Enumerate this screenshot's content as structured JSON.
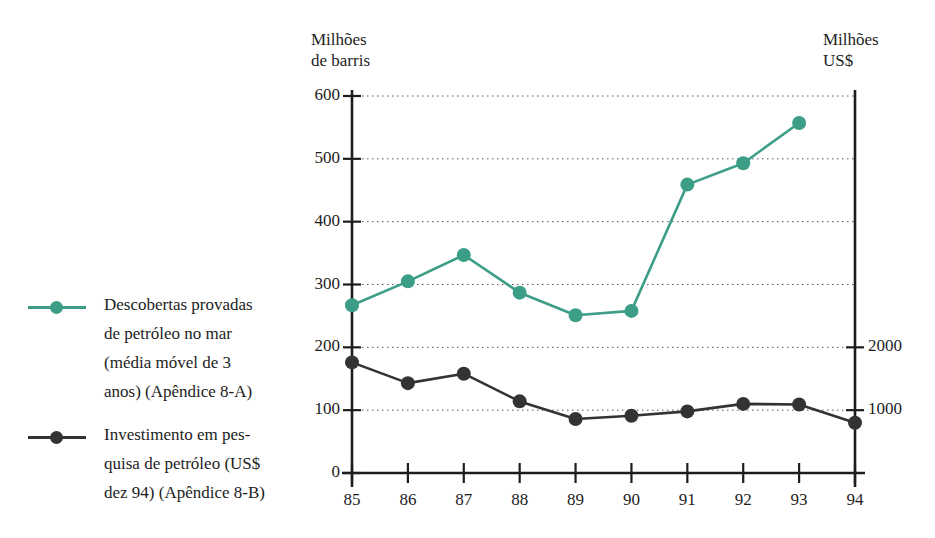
{
  "chart_data": {
    "type": "line",
    "title": "",
    "subtitle": "",
    "xlabel": "",
    "ylabel": "Milhões de barris",
    "y2label": "Milhões US$",
    "grid": true,
    "grid_style": "dotted-horizontal",
    "legend_position": "left",
    "x": [
      "85",
      "86",
      "87",
      "88",
      "89",
      "90",
      "91",
      "92",
      "93",
      "94"
    ],
    "xlim": [
      "85",
      "94"
    ],
    "ylim": [
      0,
      600
    ],
    "yticks": [
      0,
      100,
      200,
      300,
      400,
      500,
      600
    ],
    "ytick_labels": [
      "0",
      "100",
      "200",
      "300",
      "400",
      "500",
      "600"
    ],
    "y2lim": [
      0,
      6000
    ],
    "y2ticks": [
      1000,
      2000
    ],
    "y2tick_labels": [
      "1000",
      "2000"
    ],
    "series": [
      {
        "name": "Descobertas provadas de petróleo no mar (média móvel de 3 anos) (Apêndice 8-A)",
        "axis": "left",
        "color": "#3d9e87",
        "x": [
          "85",
          "86",
          "87",
          "88",
          "89",
          "90",
          "91",
          "92",
          "93"
        ],
        "values": [
          267,
          305,
          347,
          287,
          251,
          258,
          459,
          493,
          557
        ]
      },
      {
        "name": "Investimento em pesquisa de petróleo (US$ dez 94) (Apêndice 8-B)",
        "axis": "right",
        "color": "#333333",
        "x": [
          "85",
          "86",
          "87",
          "88",
          "89",
          "90",
          "91",
          "92",
          "93",
          "94"
        ],
        "values": [
          1760,
          1430,
          1580,
          1140,
          860,
          910,
          980,
          1100,
          1090,
          800
        ],
        "values_left_scale": [
          176,
          143,
          158,
          114,
          86,
          91,
          98,
          110,
          109,
          80
        ]
      }
    ]
  },
  "axes": {
    "left_title": "Milhões\nde barris",
    "right_title": "Milhões\nUS$"
  },
  "legend": {
    "entries": [
      {
        "label": "Descobertas provadas\nde petróleo no mar\n(média móvel de 3\nanos) (Apêndice 8-A)",
        "color": "#3d9e87"
      },
      {
        "label": "Investimento em pes-\nquisa de petróleo (US$\ndez 94) (Apêndice 8-B)",
        "color": "#333333"
      }
    ]
  }
}
